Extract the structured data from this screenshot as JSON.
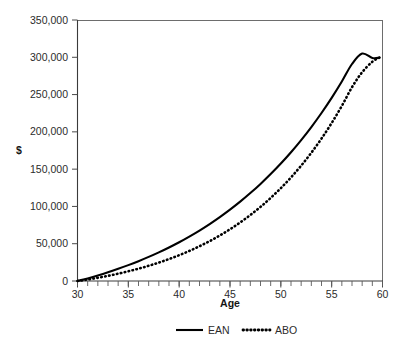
{
  "chart_data": {
    "type": "line",
    "title": "",
    "xlabel": "Age",
    "ylabel": "$",
    "xlim": [
      30,
      60
    ],
    "ylim": [
      0,
      350000
    ],
    "grid": false,
    "legend_position": "bottom",
    "x_ticks": [
      30,
      35,
      40,
      45,
      50,
      55,
      60
    ],
    "x_tick_labels": [
      "30",
      "35",
      "40",
      "45",
      "50",
      "55",
      "60"
    ],
    "x_minor_tick_step": 1,
    "y_ticks": [
      0,
      50000,
      100000,
      150000,
      200000,
      250000,
      300000,
      350000
    ],
    "y_tick_labels": [
      "0",
      "50,000",
      "100,000",
      "150,000",
      "200,000",
      "250,000",
      "300,000",
      "350,000"
    ],
    "x": [
      30,
      31,
      32,
      33,
      34,
      35,
      36,
      37,
      38,
      39,
      40,
      41,
      42,
      43,
      44,
      45,
      46,
      47,
      48,
      49,
      50,
      51,
      52,
      53,
      54,
      55,
      56,
      57,
      58,
      59,
      59.7
    ],
    "series": [
      {
        "name": "EAN",
        "style": "solid",
        "color": "#000000",
        "values": [
          0,
          3500,
          7500,
          11800,
          16400,
          21300,
          26600,
          32300,
          38400,
          45000,
          52000,
          59600,
          67700,
          76400,
          85700,
          95700,
          106400,
          117900,
          130200,
          143400,
          157500,
          172700,
          189000,
          206500,
          225300,
          245600,
          267500,
          291000,
          305000,
          299000,
          299500
        ]
      },
      {
        "name": "ABO",
        "style": "dotted",
        "color": "#000000",
        "values": [
          0,
          2000,
          4300,
          6900,
          9800,
          13000,
          16500,
          20400,
          24700,
          29400,
          34600,
          40300,
          46600,
          53500,
          61100,
          69400,
          78500,
          88500,
          99400,
          111400,
          124500,
          138900,
          154700,
          172000,
          191000,
          211900,
          234800,
          259900,
          280000,
          294000,
          299500
        ]
      }
    ],
    "legend": [
      {
        "label": "EAN",
        "style": "solid"
      },
      {
        "label": "ABO",
        "style": "dotted"
      }
    ]
  }
}
